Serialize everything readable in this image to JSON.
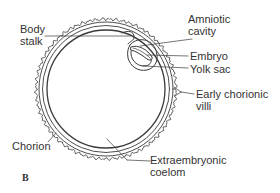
{
  "figure": {
    "panel_label": "B",
    "line_color": "#3a3a3a",
    "background": "#ffffff"
  },
  "labels": {
    "body_stalk": [
      "Body",
      "stalk"
    ],
    "amniotic_cavity": [
      "Amniotic",
      "cavity"
    ],
    "embryo": "Embryo",
    "yolk_sac": "Yolk sac",
    "early_chorionic_villi": [
      "Early chorionic",
      "villi"
    ],
    "chorion": "Chorion",
    "extraembryonic_coelom": [
      "Extraembryonic",
      "coelom"
    ]
  }
}
